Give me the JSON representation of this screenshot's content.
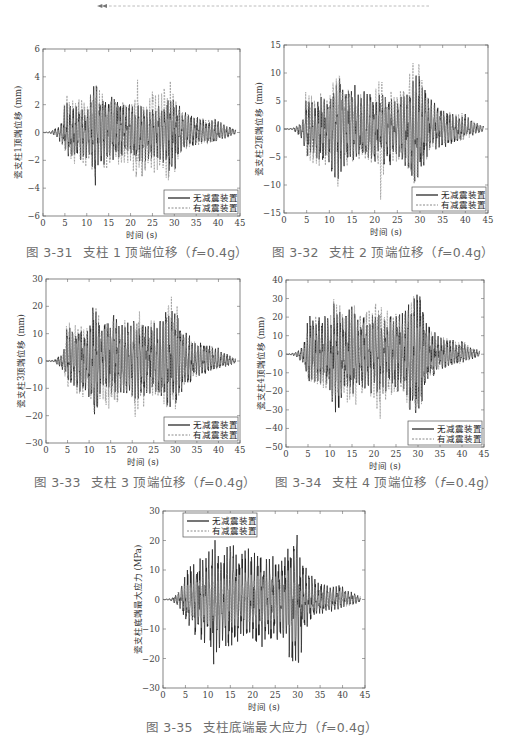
{
  "header": {
    "arrow_icon": "double-left-arrow",
    "rule_style": "dashed",
    "rule_color": "#9a9a9a"
  },
  "legend": {
    "series_a": "无减震装置",
    "series_b": "有减震装置"
  },
  "colors": {
    "series_a": "#1a1a1a",
    "series_b": "#8a8a8a",
    "caption": "#6d6d6d"
  },
  "figures": [
    {
      "num": "图 3-31",
      "title": "支柱 1 顶端位移（",
      "param": "f",
      "param_val": "=0.4g）",
      "ylabel": "瓷支柱1顶端位移 (mm)",
      "xlabel": "时间 (s)"
    },
    {
      "num": "图 3-32",
      "title": "支柱 2 顶端位移（",
      "param": "f",
      "param_val": "=0.4g）",
      "ylabel": "瓷支柱2顶端位移 (mm)",
      "xlabel": "时间 (s)"
    },
    {
      "num": "图 3-33",
      "title": "支柱 3 顶端位移（",
      "param": "f",
      "param_val": "=0.4g）",
      "ylabel": "瓷支柱3顶端位移 (mm)",
      "xlabel": "时间 (s)"
    },
    {
      "num": "图 3-34",
      "title": "支柱 4 顶端位移（",
      "param": "f",
      "param_val": "=0.4g）",
      "ylabel": "瓷支柱4顶端位移 (mm)",
      "xlabel": "时间 (s)"
    },
    {
      "num": "图 3-35",
      "title": "支柱底端最大应力（",
      "param": "f",
      "param_val": "=0.4g）",
      "ylabel": "瓷支柱底端最大应力 (MPa)",
      "xlabel": "时间 (s)"
    }
  ],
  "chart_data": [
    {
      "type": "line",
      "title": "图 3-31 支柱 1 顶端位移（f=0.4g）",
      "xlabel": "时间 (s)",
      "ylabel": "瓷支柱1顶端位移 (mm)",
      "xlim": [
        0,
        45
      ],
      "ylim": [
        -6,
        6
      ],
      "xticks": [
        0,
        5,
        10,
        15,
        20,
        25,
        30,
        35,
        40,
        45
      ],
      "yticks": [
        -6,
        -4,
        -2,
        0,
        2,
        4,
        6
      ],
      "grid": false,
      "legend_position": "lower right",
      "series": [
        {
          "name": "无减震装置",
          "style": "solid",
          "envelope_t": [
            0,
            2,
            3,
            4,
            5,
            6,
            8,
            10,
            11,
            12,
            13,
            15,
            17,
            20,
            22,
            25,
            27,
            28,
            29,
            30,
            32,
            35,
            38,
            40,
            42,
            44
          ],
          "envelope_max": [
            0,
            0.1,
            0.4,
            0.6,
            2.5,
            2.2,
            2.0,
            1.6,
            3.0,
            4.1,
            2.8,
            2.9,
            2.5,
            2.2,
            2.0,
            1.8,
            2.0,
            2.2,
            2.5,
            2.6,
            1.5,
            1.3,
            0.9,
            1.0,
            0.5,
            0.2
          ],
          "envelope_min": [
            0,
            -0.1,
            -0.4,
            -0.8,
            -1.5,
            -1.8,
            -2.0,
            -2.2,
            -3.0,
            -4.0,
            -2.5,
            -2.2,
            -2.0,
            -2.0,
            -2.2,
            -2.0,
            -2.0,
            -2.8,
            -3.0,
            -2.9,
            -1.2,
            -1.0,
            -0.8,
            -0.6,
            -0.4,
            -0.1
          ]
        },
        {
          "name": "有减震装置",
          "style": "dashed",
          "envelope_t": [
            0,
            2,
            3,
            4,
            5,
            6,
            8,
            10,
            11,
            12,
            13,
            15,
            17,
            20,
            21.5,
            22,
            25,
            27,
            28.5,
            30,
            32,
            35,
            38,
            40,
            42,
            44
          ],
          "envelope_max": [
            0,
            0.1,
            0.3,
            0.5,
            3.4,
            2.5,
            2.6,
            2.2,
            2.9,
            4.2,
            3.0,
            3.0,
            2.5,
            2.2,
            4.5,
            2.0,
            3.0,
            2.8,
            4.8,
            3.5,
            1.5,
            1.2,
            1.0,
            1.0,
            0.5,
            0.2
          ],
          "envelope_min": [
            0,
            -0.1,
            -0.3,
            -0.6,
            -1.7,
            -2.0,
            -2.8,
            -2.5,
            -3.0,
            -3.9,
            -2.5,
            -3.0,
            -2.5,
            -2.5,
            -5.1,
            -3.6,
            -3.0,
            -2.8,
            -4.2,
            -3.0,
            -1.4,
            -1.0,
            -0.9,
            -0.6,
            -0.4,
            -0.1
          ]
        }
      ]
    },
    {
      "type": "line",
      "title": "图 3-32 支柱 2 顶端位移（f=0.4g）",
      "xlabel": "时间 (s)",
      "ylabel": "瓷支柱2顶端位移 (mm)",
      "xlim": [
        0,
        45
      ],
      "ylim": [
        -15,
        15
      ],
      "xticks": [
        0,
        5,
        10,
        15,
        20,
        25,
        30,
        35,
        40,
        45
      ],
      "yticks": [
        -15,
        -10,
        -5,
        0,
        5,
        10,
        15
      ],
      "grid": false,
      "legend_position": "lower right",
      "series": [
        {
          "name": "无减震装置",
          "style": "solid",
          "envelope_t": [
            0,
            2,
            3,
            4,
            5,
            6,
            8,
            10,
            11,
            12,
            13,
            15,
            17,
            20,
            22,
            25,
            27,
            28,
            29,
            30,
            32,
            35,
            38,
            40,
            42,
            44
          ],
          "envelope_max": [
            0,
            0.2,
            0.8,
            1.5,
            6.0,
            5.5,
            6.5,
            6.0,
            8.0,
            10.0,
            7.0,
            8.5,
            7.0,
            7.0,
            6.0,
            6.0,
            7.0,
            9.0,
            10.0,
            11.5,
            6.0,
            4.0,
            3.0,
            3.0,
            1.5,
            0.5
          ],
          "envelope_min": [
            0,
            -0.2,
            -1.0,
            -2.0,
            -5.0,
            -5.5,
            -6.5,
            -7.0,
            -10.5,
            -10.0,
            -7.0,
            -6.5,
            -6.0,
            -6.0,
            -7.0,
            -6.0,
            -7.0,
            -9.0,
            -10.0,
            -10.5,
            -5.0,
            -3.5,
            -2.5,
            -2.0,
            -1.0,
            -0.4
          ]
        },
        {
          "name": "有减震装置",
          "style": "dashed",
          "envelope_t": [
            0,
            2,
            3,
            4,
            5,
            6,
            8,
            10,
            11,
            12,
            13,
            15,
            17,
            20,
            21.5,
            22,
            25,
            27,
            28.5,
            30,
            32,
            35,
            38,
            40,
            42,
            44
          ],
          "envelope_max": [
            0,
            0.2,
            0.6,
            1.2,
            9.0,
            6.0,
            7.0,
            6.5,
            10.0,
            11.3,
            7.5,
            8.0,
            6.5,
            7.0,
            12.0,
            7.0,
            7.0,
            8.0,
            12.8,
            12.0,
            5.0,
            3.5,
            3.0,
            3.0,
            1.5,
            0.5
          ],
          "envelope_min": [
            0,
            -0.2,
            -0.8,
            -1.6,
            -5.5,
            -6.0,
            -7.0,
            -6.5,
            -9.5,
            -10.8,
            -7.0,
            -7.0,
            -6.0,
            -6.5,
            -13.7,
            -8.0,
            -6.5,
            -7.0,
            -10.0,
            -9.0,
            -4.5,
            -3.0,
            -2.5,
            -2.0,
            -1.0,
            -0.4
          ]
        }
      ]
    },
    {
      "type": "line",
      "title": "图 3-33 支柱 3 顶端位移（f=0.4g）",
      "xlabel": "时间 (s)",
      "ylabel": "瓷支柱3顶端位移 (mm)",
      "xlim": [
        0,
        45
      ],
      "ylim": [
        -30,
        30
      ],
      "xticks": [
        0,
        5,
        10,
        15,
        20,
        25,
        30,
        35,
        40,
        45
      ],
      "yticks": [
        -30,
        -20,
        -10,
        0,
        10,
        20,
        30
      ],
      "grid": false,
      "legend_position": "lower right",
      "series": [
        {
          "name": "无减震装置",
          "style": "solid",
          "envelope_t": [
            0,
            2,
            3,
            4,
            5,
            6,
            8,
            10,
            11,
            12,
            13,
            15,
            17,
            20,
            22,
            25,
            27,
            28,
            29,
            30,
            32,
            35,
            38,
            40,
            42,
            44
          ],
          "envelope_max": [
            0,
            0.5,
            2.0,
            3.5,
            14.0,
            12.0,
            14.0,
            12.0,
            22.0,
            18.0,
            14.0,
            19.0,
            15.0,
            15.0,
            14.0,
            14.0,
            16.0,
            20.0,
            22.0,
            24.0,
            12.0,
            7.0,
            6.0,
            5.0,
            3.0,
            1.0
          ],
          "envelope_min": [
            0,
            -0.5,
            -2.0,
            -4.0,
            -10.0,
            -11.0,
            -12.0,
            -14.0,
            -22.5,
            -20.0,
            -14.0,
            -14.0,
            -12.0,
            -14.0,
            -15.0,
            -13.0,
            -14.0,
            -18.0,
            -20.0,
            -21.0,
            -10.0,
            -6.0,
            -4.0,
            -3.0,
            -2.0,
            -0.8
          ]
        },
        {
          "name": "有减震装置",
          "style": "dashed",
          "envelope_t": [
            0,
            2,
            3,
            4,
            5,
            6,
            8,
            10,
            11,
            12,
            13,
            15,
            17,
            20,
            21.5,
            22,
            25,
            27,
            28.5,
            30,
            32,
            35,
            38,
            40,
            42,
            44
          ],
          "envelope_max": [
            0,
            0.4,
            1.5,
            3.0,
            18.0,
            13.0,
            14.0,
            13.0,
            21.0,
            22.0,
            15.0,
            19.0,
            15.0,
            17.0,
            23.0,
            15.0,
            15.0,
            16.0,
            25.0,
            25.0,
            10.0,
            7.0,
            6.0,
            5.0,
            3.0,
            1.0
          ],
          "envelope_min": [
            0,
            -0.4,
            -1.5,
            -3.5,
            -11.0,
            -12.0,
            -14.0,
            -13.0,
            -21.0,
            -20.0,
            -14.0,
            -20.0,
            -14.0,
            -16.0,
            -26.5,
            -18.0,
            -14.0,
            -16.0,
            -20.0,
            -19.0,
            -9.0,
            -6.0,
            -4.0,
            -3.0,
            -2.0,
            -0.8
          ]
        }
      ]
    },
    {
      "type": "line",
      "title": "图 3-34 支柱 4 顶端位移（f=0.4g）",
      "xlabel": "时间 (s)",
      "ylabel": "瓷支柱4顶端位移 (mm)",
      "xlim": [
        0,
        45
      ],
      "ylim": [
        -50,
        40
      ],
      "xticks": [
        0,
        5,
        10,
        15,
        20,
        25,
        30,
        35,
        40,
        45
      ],
      "yticks": [
        -50,
        -40,
        -30,
        -20,
        -10,
        0,
        10,
        20,
        30,
        40
      ],
      "grid": false,
      "legend_position": "lower right",
      "series": [
        {
          "name": "无减震装置",
          "style": "solid",
          "envelope_t": [
            0,
            2,
            3,
            4,
            5,
            6,
            8,
            10,
            11,
            12,
            13,
            15,
            17,
            20,
            22,
            25,
            27,
            28,
            29,
            30,
            32,
            35,
            38,
            40,
            42,
            44
          ],
          "envelope_max": [
            0,
            1.0,
            3.0,
            5.0,
            22.0,
            20.0,
            22.0,
            20.0,
            35.0,
            28.0,
            20.0,
            30.0,
            22.0,
            24.0,
            22.0,
            22.0,
            24.0,
            30.0,
            34.0,
            38.0,
            18.0,
            10.0,
            8.0,
            8.0,
            4.0,
            2.0
          ],
          "envelope_min": [
            0,
            -1.0,
            -3.0,
            -5.0,
            -16.0,
            -17.0,
            -19.0,
            -20.0,
            -36.0,
            -33.0,
            -22.0,
            -22.0,
            -20.0,
            -22.0,
            -24.0,
            -20.0,
            -22.0,
            -30.0,
            -34.0,
            -37.0,
            -15.0,
            -9.0,
            -6.0,
            -5.0,
            -3.0,
            -1.0
          ]
        },
        {
          "name": "有减震装置",
          "style": "dashed",
          "envelope_t": [
            0,
            2,
            3,
            4,
            5,
            6,
            8,
            10,
            11,
            12,
            13,
            15,
            17,
            20,
            21.5,
            22,
            25,
            27,
            28.5,
            30,
            32,
            35,
            38,
            40,
            42,
            44
          ],
          "envelope_max": [
            0,
            0.8,
            2.5,
            4.5,
            26.0,
            20.0,
            22.0,
            22.0,
            35.0,
            33.0,
            24.0,
            30.0,
            25.0,
            27.0,
            35.0,
            24.0,
            24.0,
            25.0,
            38.0,
            40.0,
            15.0,
            10.0,
            8.0,
            8.0,
            4.0,
            2.0
          ],
          "envelope_min": [
            0,
            -0.8,
            -2.5,
            -4.5,
            -17.0,
            -18.0,
            -22.0,
            -22.0,
            -35.0,
            -33.0,
            -22.0,
            -32.0,
            -24.0,
            -26.0,
            -40.0,
            -28.0,
            -22.0,
            -24.0,
            -36.0,
            -38.0,
            -14.0,
            -9.0,
            -6.0,
            -5.0,
            -3.0,
            -1.0
          ]
        }
      ]
    },
    {
      "type": "line",
      "title": "图 3-35 支柱底端最大应力（f=0.4g）",
      "xlabel": "时间 (s)",
      "ylabel": "瓷支柱底端最大应力 (MPa)",
      "xlim": [
        0,
        45
      ],
      "ylim": [
        -30,
        30
      ],
      "xticks": [
        0,
        5,
        10,
        15,
        20,
        25,
        30,
        35,
        40,
        45
      ],
      "yticks": [
        -30,
        -20,
        -10,
        0,
        10,
        20,
        30
      ],
      "grid": false,
      "legend_position": "upper left",
      "series": [
        {
          "name": "无减震装置",
          "style": "solid",
          "envelope_t": [
            0,
            2,
            3,
            4,
            5,
            6,
            8,
            10,
            11,
            12,
            13,
            15,
            17,
            20,
            22,
            25,
            27,
            28,
            29,
            30,
            32,
            35,
            38,
            40,
            42,
            44
          ],
          "envelope_max": [
            0,
            0.5,
            2.0,
            4.0,
            12.0,
            12.0,
            15.0,
            16.0,
            22.0,
            19.0,
            15.0,
            20.0,
            17.0,
            18.0,
            16.0,
            15.0,
            15.0,
            21.0,
            24.0,
            27.0,
            12.0,
            6.0,
            5.0,
            5.0,
            3.0,
            1.0
          ],
          "envelope_min": [
            0,
            -0.5,
            -2.0,
            -4.0,
            -8.0,
            -10.0,
            -14.0,
            -16.0,
            -24.0,
            -20.0,
            -15.0,
            -20.0,
            -16.0,
            -17.0,
            -18.0,
            -15.0,
            -15.0,
            -20.0,
            -22.0,
            -24.0,
            -10.0,
            -6.0,
            -4.0,
            -3.0,
            -2.0,
            -1.0
          ]
        },
        {
          "name": "有减震装置",
          "style": "dashed",
          "envelope_t": [
            0,
            2,
            3,
            4,
            5,
            6,
            8,
            10,
            11,
            12,
            13,
            15,
            17,
            20,
            22,
            25,
            27,
            28,
            29,
            30,
            32,
            35,
            38,
            40,
            42,
            44
          ],
          "envelope_max": [
            0,
            0.5,
            2.0,
            3.5,
            6.0,
            7.0,
            8.0,
            8.0,
            9.0,
            8.0,
            7.0,
            8.0,
            7.0,
            8.0,
            9.0,
            8.0,
            7.0,
            7.0,
            8.0,
            8.0,
            5.0,
            4.0,
            3.0,
            3.0,
            2.0,
            1.0
          ],
          "envelope_min": [
            0,
            -0.5,
            -2.0,
            -3.5,
            -6.0,
            -7.0,
            -8.0,
            -8.0,
            -9.0,
            -8.0,
            -7.0,
            -8.0,
            -7.0,
            -8.0,
            -9.0,
            -8.0,
            -7.0,
            -7.0,
            -8.0,
            -8.0,
            -5.0,
            -4.0,
            -3.0,
            -3.0,
            -2.0,
            -1.0
          ]
        }
      ]
    }
  ]
}
